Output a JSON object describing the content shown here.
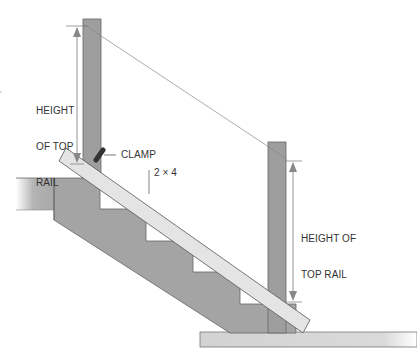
{
  "diagram": {
    "labels": {
      "left_height": [
        "HEIGHT",
        "OF TOP",
        "RAIL"
      ],
      "right_height": [
        "HEIGHT OF",
        "TOP RAIL"
      ],
      "clamp": "CLAMP",
      "board": "2 × 4"
    },
    "colors": {
      "stringer": "#a4a4a4",
      "post": "#9e9e9e",
      "board": "#e4e4e4",
      "floor": "#d6d6d6",
      "line": "#555555",
      "arrow": "#777777"
    }
  }
}
